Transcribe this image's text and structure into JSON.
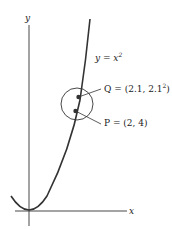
{
  "diagram": {
    "axes": {
      "x_label": "x",
      "y_label": "y"
    },
    "curve": {
      "equation_lhs": "y = x",
      "equation_exp": "2"
    },
    "points": [
      {
        "name": "Q",
        "label_prefix": "Q = (2.1, 2.1",
        "label_exp": "2",
        "label_suffix": ")"
      },
      {
        "name": "P",
        "label": "P = (2, 4)"
      }
    ],
    "colors": {
      "ink": "#222222",
      "background": "#ffffff"
    }
  }
}
